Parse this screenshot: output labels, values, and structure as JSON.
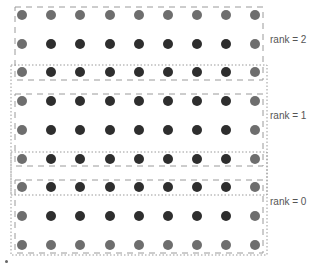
{
  "diagram": {
    "grid": {
      "columns": 9,
      "rows": 9,
      "col_x": [
        22,
        51,
        80,
        110,
        139,
        168,
        197,
        226,
        255
      ],
      "row_y": [
        15,
        44,
        72,
        101,
        130,
        159,
        187,
        216,
        245
      ],
      "dot_radius": 5
    },
    "colors": {
      "boundary_point": "#6e6e6e",
      "interior_point": "#2e2e2e",
      "dashed_border": "#9a9a9a",
      "dotted_border": "#9a9a9a",
      "label_text": "#555555"
    },
    "ranks": [
      {
        "label": "rank = 2",
        "rows": [
          0,
          1,
          2
        ],
        "label_x": 270,
        "label_y": 40
      },
      {
        "label": "rank = 1",
        "rows": [
          3,
          4,
          5
        ],
        "label_x": 270,
        "label_y": 112
      },
      {
        "label": "rank = 0",
        "rows": [
          6,
          7,
          8
        ],
        "label_x": 270,
        "label_y": 198
      }
    ],
    "dashed_boxes": [
      {
        "name": "rank-2-domain",
        "x": 15,
        "y": 7,
        "w": 248,
        "h": 73
      },
      {
        "name": "rank-1-domain",
        "x": 15,
        "y": 94,
        "w": 248,
        "h": 72
      },
      {
        "name": "rank-0-domain",
        "x": 15,
        "y": 180,
        "w": 248,
        "h": 73
      }
    ],
    "dotted_boxes": [
      {
        "name": "rank-1-halo",
        "x": 11,
        "y": 65,
        "w": 256,
        "h": 130
      },
      {
        "name": "rank-0-halo-left",
        "x": 11,
        "y": 152,
        "w": 256,
        "h": 103
      }
    ]
  }
}
